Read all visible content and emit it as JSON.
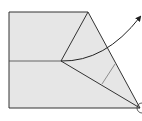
{
  "diagram": {
    "type": "origami-fold-diagram",
    "colors": {
      "paper_fill": "#e6e6e6",
      "stroke": "#333333",
      "background": "#ffffff"
    },
    "shapes": {
      "paper_outline": "9,12 88,12 140,108 9,108",
      "crease_horizontal": {
        "x1": 9,
        "y1": 61,
        "x2": 61,
        "y2": 61
      },
      "fold_line_top": {
        "x1": 61,
        "y1": 61,
        "x2": 88,
        "y2": 12
      },
      "fold_line_bottom": {
        "x1": 61,
        "y1": 61,
        "x2": 140,
        "y2": 108
      },
      "reference_line": {
        "x1": 102,
        "y1": 84,
        "x2": 115,
        "y2": 64
      },
      "fold_arrow_path": "M61,61 Q105,62 140,17",
      "pivot_marker": {
        "cx": 140,
        "cy": 108,
        "r": 5
      }
    }
  }
}
